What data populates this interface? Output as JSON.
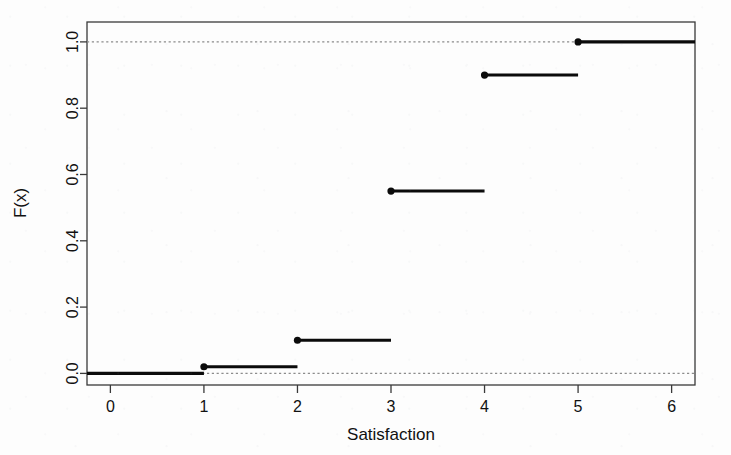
{
  "chart_data": {
    "type": "line",
    "subtype": "ecdf-step",
    "title": "",
    "subtitle": "",
    "xlabel": "Satisfaction",
    "ylabel": "F(x)",
    "xlim": [
      -0.25,
      6.25
    ],
    "ylim": [
      -0.035,
      1.06
    ],
    "xticks": [
      0,
      1,
      2,
      3,
      4,
      5,
      6
    ],
    "xticklabels": [
      "0",
      "1",
      "2",
      "3",
      "4",
      "5",
      "6"
    ],
    "yticks": [
      0.0,
      0.2,
      0.4,
      0.6,
      0.8,
      1.0
    ],
    "yticklabels": [
      "0.0",
      "0.2",
      "0.4",
      "0.6",
      "0.8",
      "1.0"
    ],
    "grid": false,
    "legend": null,
    "reference_lines": [
      {
        "orientation": "horizontal",
        "value": 0.0,
        "style": "dotted",
        "color": "#8c8c8c"
      },
      {
        "orientation": "horizontal",
        "value": 1.0,
        "style": "dotted",
        "color": "#8c8c8c"
      }
    ],
    "x": [
      1,
      2,
      3,
      4,
      5
    ],
    "y": [
      0.02,
      0.1,
      0.55,
      0.9,
      1.0
    ],
    "steps": [
      {
        "x_start": -0.25,
        "x_end": 1.0,
        "y": 0.0,
        "dot": false,
        "label": "pre-step"
      },
      {
        "x_start": 1.0,
        "x_end": 2.0,
        "y": 0.02,
        "dot": true,
        "label": "F(1)"
      },
      {
        "x_start": 2.0,
        "x_end": 3.0,
        "y": 0.1,
        "dot": true,
        "label": "F(2)"
      },
      {
        "x_start": 3.0,
        "x_end": 4.0,
        "y": 0.55,
        "dot": true,
        "label": "F(3)"
      },
      {
        "x_start": 4.0,
        "x_end": 5.0,
        "y": 0.9,
        "dot": true,
        "label": "F(4)"
      },
      {
        "x_start": 5.0,
        "x_end": 6.25,
        "y": 1.0,
        "dot": true,
        "label": "F(5)"
      }
    ],
    "colors": {
      "step_line": "#0b0b0b",
      "reference_line": "#8c8c8c",
      "axis": "#3a3a3a",
      "text": "#111111",
      "background": "#fdfdfd"
    }
  }
}
